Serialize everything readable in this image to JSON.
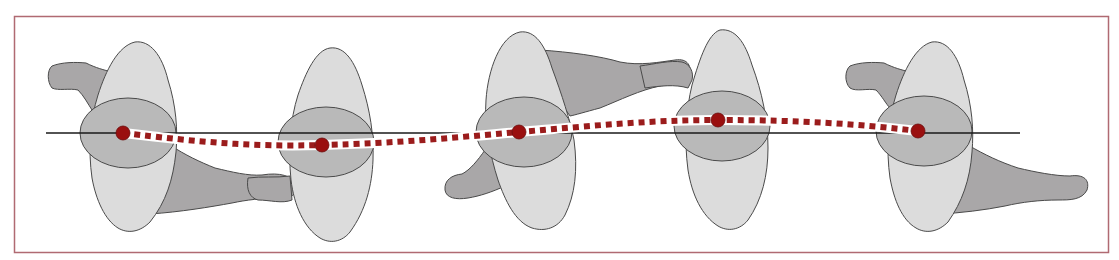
{
  "diagram": {
    "title": "",
    "frame": {
      "x": 14,
      "y": 16,
      "width": 1095,
      "height": 237,
      "stroke": "#b06a72"
    },
    "reference_line": {
      "x1": 46,
      "y1": 133,
      "x2": 1020,
      "y2": 133,
      "color": "#1a1a1a"
    },
    "path": {
      "color": "#9b1c1c",
      "halo": "#ffffff",
      "points": [
        [
          123,
          133
        ],
        [
          322,
          145
        ],
        [
          519,
          132
        ],
        [
          718,
          120
        ],
        [
          918,
          131
        ]
      ]
    },
    "colors": {
      "body": "#dcdcdc",
      "head": "#b9b9b9",
      "limb": "#a9a7a8",
      "outline": "#4a4a4a",
      "dot": "#9a0f0f"
    },
    "figures": [
      {
        "id": 1,
        "cx": 123,
        "cy": 133,
        "limb_side": "upper-left",
        "limb2_side": "lower-right"
      },
      {
        "id": 2,
        "cx": 322,
        "cy": 145,
        "limb_side": "lower-left"
      },
      {
        "id": 3,
        "cx": 519,
        "cy": 132,
        "limb_side": "upper-right",
        "limb2_side": "lower-left"
      },
      {
        "id": 4,
        "cx": 718,
        "cy": 120,
        "limb_side": "upper-left"
      },
      {
        "id": 5,
        "cx": 918,
        "cy": 131,
        "limb_side": "upper-left",
        "limb2_side": "lower-right"
      }
    ]
  }
}
